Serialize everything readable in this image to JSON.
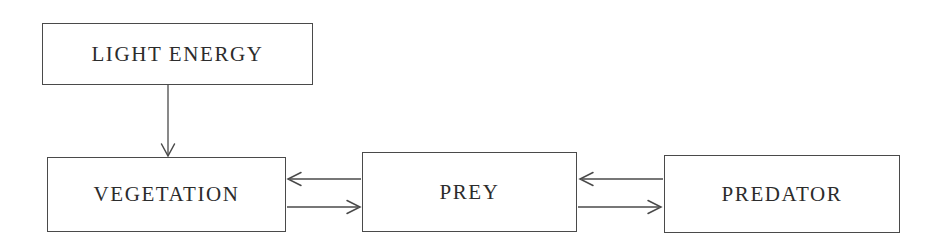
{
  "diagram": {
    "background_color": "#ffffff",
    "line_color": "#4a4a4a",
    "text_color": "#2c2c2c",
    "nodes": [
      {
        "id": "light-energy",
        "label": "LIGHT ENERGY"
      },
      {
        "id": "vegetation",
        "label": "VEGETATION"
      },
      {
        "id": "prey",
        "label": "PREY"
      },
      {
        "id": "predator",
        "label": "PREDATOR"
      }
    ],
    "edges": [
      {
        "id": "light-to-vegetation",
        "from": "light-energy",
        "to": "vegetation",
        "direction": "down"
      },
      {
        "id": "prey-to-vegetation",
        "from": "prey",
        "to": "vegetation",
        "direction": "left"
      },
      {
        "id": "vegetation-to-prey",
        "from": "vegetation",
        "to": "prey",
        "direction": "right"
      },
      {
        "id": "predator-to-prey",
        "from": "predator",
        "to": "prey",
        "direction": "left"
      },
      {
        "id": "prey-to-predator",
        "from": "prey",
        "to": "predator",
        "direction": "right"
      }
    ]
  }
}
